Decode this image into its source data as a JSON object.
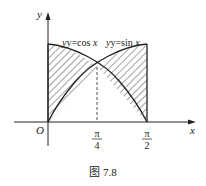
{
  "figure": {
    "caption": "图 7.8",
    "axes": {
      "x_label": "x",
      "y_label": "y",
      "origin_label": "O"
    },
    "ticks": [
      {
        "num": "π",
        "den": "4",
        "value": 0.7854
      },
      {
        "num": "π",
        "den": "2",
        "value": 1.5708
      }
    ],
    "curves": [
      {
        "name": "cos",
        "label_prefix": "y=cos ",
        "label_var": "x"
      },
      {
        "name": "sin",
        "label_prefix": "y=sin ",
        "label_var": "x"
      }
    ],
    "shaded_regions": "Area between y=cos x and y=sin x on [0, π/2]",
    "intersection": {
      "x": "π/4",
      "y": 0.7071
    }
  },
  "colors": {
    "line": "#222222",
    "hatch": "#333333",
    "background": "#ffffff"
  }
}
